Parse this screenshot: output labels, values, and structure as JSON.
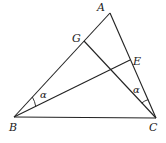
{
  "diagram": {
    "points": {
      "A": {
        "label": "A",
        "x": 110,
        "y": 13
      },
      "B": {
        "label": "B",
        "x": 14,
        "y": 117
      },
      "C": {
        "label": "C",
        "x": 156,
        "y": 118
      },
      "G": {
        "label": "G",
        "x": 84,
        "y": 41
      },
      "E": {
        "label": "E",
        "x": 130,
        "y": 60
      }
    },
    "segments": [
      "AB",
      "AC",
      "BC",
      "BE",
      "CG"
    ],
    "angles": [
      {
        "vertex": "B",
        "between": [
          "BG",
          "BE"
        ],
        "label": "α"
      },
      {
        "vertex": "C",
        "between": [
          "CE",
          "CG"
        ],
        "label": "α"
      }
    ]
  }
}
